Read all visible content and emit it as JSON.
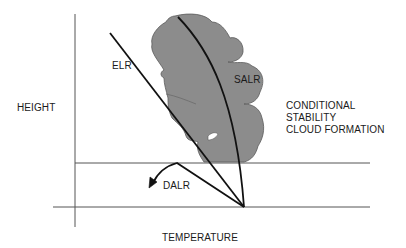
{
  "diagram": {
    "axes": {
      "y_label": "HEIGHT",
      "x_label": "TEMPERATURE"
    },
    "lines": {
      "elr_label": "ELR",
      "salr_label": "SALR",
      "dalr_label": "DALR"
    },
    "annotation": {
      "lines": [
        "CONDITIONAL",
        "STABILITY",
        "CLOUD FORMATION"
      ]
    },
    "colors": {
      "cloud_fill": "#8c8c8c",
      "cloud_outline": "#5a5a5a",
      "line": "#111111",
      "axis": "#555555",
      "text": "#1a1a1a"
    }
  }
}
